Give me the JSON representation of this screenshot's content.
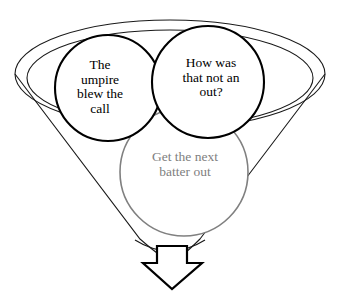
{
  "diagram": {
    "type": "funnel-with-thought-bubbles",
    "background_color": "#ffffff",
    "funnel": {
      "name": "funnel-shape",
      "outline_color": "#1a1a1a",
      "rim_count": 2,
      "fill": "none"
    },
    "arrow": {
      "name": "output-arrow",
      "direction": "down",
      "outline_color": "#000000",
      "fill": "#ffffff"
    },
    "bubbles": [
      {
        "id": "umpire",
        "label": "The\numpire\nblew the\ncall",
        "stroke_color": "#000000",
        "text_color": "#000000",
        "emphasis": "strong"
      },
      {
        "id": "out",
        "label": "How was\nthat not an\nout?",
        "stroke_color": "#000000",
        "text_color": "#000000",
        "emphasis": "strong"
      },
      {
        "id": "batter",
        "label": "Get the next\nbatter out",
        "stroke_color": "#808080",
        "text_color": "#808080",
        "emphasis": "faded"
      }
    ]
  }
}
